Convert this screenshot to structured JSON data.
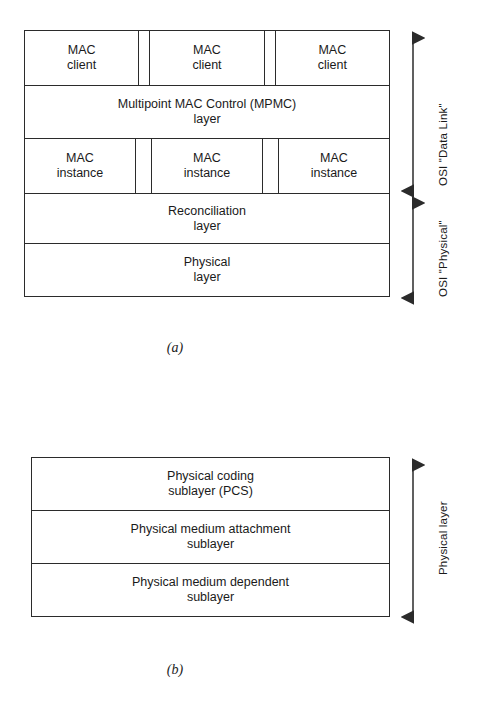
{
  "figure_a": {
    "caption": "(a)",
    "client_row": [
      {
        "line1": "MAC",
        "line2": "client"
      },
      {
        "line1": "MAC",
        "line2": "client"
      },
      {
        "line1": "MAC",
        "line2": "client"
      }
    ],
    "mpmc_row": {
      "line1": "Multipoint MAC Control (MPMC)",
      "line2": "layer"
    },
    "instance_row": [
      {
        "line1": "MAC",
        "line2": "instance"
      },
      {
        "line1": "MAC",
        "line2": "instance"
      },
      {
        "line1": "MAC",
        "line2": "instance"
      }
    ],
    "reconciliation_row": {
      "line1": "Reconciliation",
      "line2": "layer"
    },
    "physical_row": {
      "line1": "Physical",
      "line2": "layer"
    },
    "side_labels": {
      "data_link": "OSI \"Data Link\"",
      "physical": "OSI \"Physical\""
    }
  },
  "figure_b": {
    "caption": "(b)",
    "rows": [
      {
        "line1": "Physical coding",
        "line2": "sublayer (PCS)"
      },
      {
        "line1": "Physical medium attachment",
        "line2": "sublayer"
      },
      {
        "line1": "Physical medium dependent",
        "line2": "sublayer"
      }
    ],
    "side_label": "Physical layer"
  },
  "colors": {
    "background": "#ffffff",
    "stroke": "#2b2b2b",
    "text": "#1a1a1a"
  }
}
